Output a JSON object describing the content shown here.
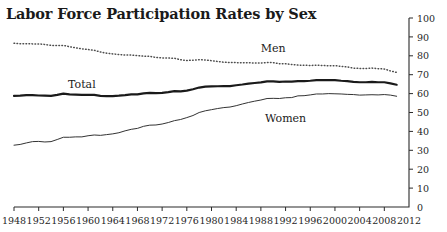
{
  "chart_data": {
    "type": "line",
    "title": "Labor Force Participation Rates by Sex",
    "xlabel": "",
    "ylabel": "",
    "xlim": [
      1948,
      2012
    ],
    "ylim": [
      0,
      100
    ],
    "grid": false,
    "legend_position": "inline-annotations",
    "y_ticks": [
      0,
      10,
      20,
      30,
      40,
      50,
      60,
      70,
      80,
      90,
      100
    ],
    "y_tick_labels": [
      "0",
      "10",
      "20",
      "30",
      "40",
      "50",
      "60",
      "70",
      "80",
      "90",
      "100"
    ],
    "x_ticks": [
      1948,
      1952,
      1956,
      1960,
      1964,
      1968,
      1972,
      1976,
      1980,
      1984,
      1988,
      1992,
      1996,
      2000,
      2004,
      2008,
      2012
    ],
    "x_tick_labels": [
      "1948",
      "1952",
      "1956",
      "1960",
      "1964",
      "1968",
      "1972",
      "1976",
      "1980",
      "1984",
      "1988",
      "1992",
      "1996",
      "2000",
      "2004",
      "2008",
      "2012"
    ],
    "annotations": [
      {
        "text": "Men",
        "x": 1990,
        "y": 82
      },
      {
        "text": "Total",
        "x": 1959,
        "y": 63
      },
      {
        "text": "Women",
        "x": 1992,
        "y": 45
      }
    ],
    "x": [
      1948,
      1949,
      1950,
      1951,
      1952,
      1953,
      1954,
      1955,
      1956,
      1957,
      1958,
      1959,
      1960,
      1961,
      1962,
      1963,
      1964,
      1965,
      1966,
      1967,
      1968,
      1969,
      1970,
      1971,
      1972,
      1973,
      1974,
      1975,
      1976,
      1977,
      1978,
      1979,
      1980,
      1981,
      1982,
      1983,
      1984,
      1985,
      1986,
      1987,
      1988,
      1989,
      1990,
      1991,
      1992,
      1993,
      1994,
      1995,
      1996,
      1997,
      1998,
      1999,
      2000,
      2001,
      2002,
      2003,
      2004,
      2005,
      2006,
      2007,
      2008,
      2009,
      2010
    ],
    "series": [
      {
        "name": "Men",
        "style": "dotted",
        "color": "#4d4d4d",
        "values": [
          86.6,
          86.4,
          86.4,
          86.3,
          86.3,
          86.0,
          85.5,
          85.4,
          85.5,
          84.8,
          84.2,
          83.7,
          83.3,
          82.9,
          82.0,
          81.4,
          81.0,
          80.7,
          80.4,
          80.4,
          80.1,
          79.8,
          79.7,
          79.1,
          78.9,
          78.8,
          78.7,
          77.9,
          77.5,
          77.7,
          77.9,
          77.8,
          77.4,
          77.0,
          76.6,
          76.4,
          76.4,
          76.3,
          76.3,
          76.2,
          76.2,
          76.4,
          76.4,
          75.8,
          75.8,
          75.4,
          75.1,
          75.0,
          74.9,
          75.0,
          74.9,
          74.7,
          74.8,
          74.4,
          74.1,
          73.5,
          73.3,
          73.3,
          73.5,
          73.2,
          73.0,
          72.0,
          71.2
        ]
      },
      {
        "name": "Total",
        "style": "solid-bold",
        "color": "#1a1a1a",
        "values": [
          58.8,
          58.9,
          59.2,
          59.2,
          59.0,
          58.9,
          58.8,
          59.3,
          60.0,
          59.6,
          59.5,
          59.3,
          59.4,
          59.3,
          58.8,
          58.7,
          58.7,
          58.9,
          59.2,
          59.6,
          59.6,
          60.1,
          60.4,
          60.2,
          60.4,
          60.8,
          61.3,
          61.2,
          61.6,
          62.3,
          63.2,
          63.7,
          63.8,
          63.9,
          64.0,
          64.0,
          64.4,
          64.8,
          65.3,
          65.6,
          65.9,
          66.5,
          66.5,
          66.2,
          66.4,
          66.3,
          66.6,
          66.6,
          66.8,
          67.1,
          67.1,
          67.1,
          67.1,
          66.8,
          66.6,
          66.2,
          66.0,
          66.0,
          66.2,
          66.0,
          66.0,
          65.4,
          64.7
        ]
      },
      {
        "name": "Women",
        "style": "solid-thin",
        "color": "#333333",
        "values": [
          32.7,
          33.1,
          33.9,
          34.6,
          34.7,
          34.4,
          34.6,
          35.7,
          36.9,
          36.9,
          37.1,
          37.1,
          37.7,
          38.1,
          37.9,
          38.3,
          38.7,
          39.3,
          40.3,
          41.1,
          41.6,
          42.7,
          43.3,
          43.4,
          43.9,
          44.7,
          45.7,
          46.3,
          47.3,
          48.4,
          50.0,
          50.9,
          51.5,
          52.1,
          52.6,
          52.9,
          53.6,
          54.5,
          55.3,
          56.0,
          56.6,
          57.4,
          57.5,
          57.4,
          57.8,
          57.9,
          58.8,
          58.9,
          59.3,
          59.8,
          59.8,
          60.0,
          59.9,
          59.8,
          59.6,
          59.5,
          59.2,
          59.3,
          59.4,
          59.3,
          59.5,
          59.2,
          58.6
        ]
      }
    ]
  }
}
